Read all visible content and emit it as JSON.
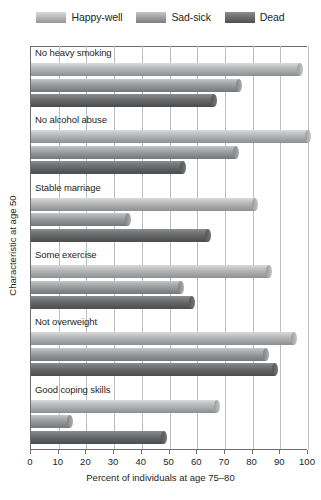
{
  "legend": {
    "position": "top",
    "entries": [
      {
        "label": "Happy-well",
        "color": "#b6b7b9",
        "swatch_icon": "legend-swatch-icon"
      },
      {
        "label": "Sad-sick",
        "color": "#9fa0a2",
        "swatch_icon": "legend-swatch-icon"
      },
      {
        "label": "Dead",
        "color": "#6b6c6e",
        "swatch_icon": "legend-swatch-icon"
      }
    ]
  },
  "axes": {
    "x_title": "Percent of individuals at age 75–80",
    "y_title": "Characteristic at age 50",
    "x_ticks": [
      "0",
      "10",
      "20",
      "30",
      "40",
      "50",
      "60",
      "70",
      "80",
      "90",
      "100"
    ]
  },
  "chart_data": {
    "type": "bar",
    "orientation": "horizontal",
    "title": "",
    "xlabel": "Percent of individuals at age 75–80",
    "ylabel": "Characteristic at age 50",
    "xlim": [
      0,
      100
    ],
    "xticks": [
      0,
      10,
      20,
      30,
      40,
      50,
      60,
      70,
      80,
      90,
      100
    ],
    "grid": true,
    "legend_position": "top",
    "categories": [
      "No heavy smoking",
      "No alcohol abuse",
      "Stable marriage",
      "Some exercise",
      "Not overweight",
      "Good coping skills"
    ],
    "series": [
      {
        "name": "Happy-well",
        "color": "#b6b7b9",
        "values": [
          97,
          100,
          81,
          86,
          95,
          67
        ]
      },
      {
        "name": "Sad-sick",
        "color": "#9fa0a2",
        "values": [
          75,
          74,
          35,
          54,
          85,
          14
        ]
      },
      {
        "name": "Dead",
        "color": "#6b6c6e",
        "values": [
          66,
          55,
          64,
          58,
          88,
          48
        ]
      }
    ]
  }
}
